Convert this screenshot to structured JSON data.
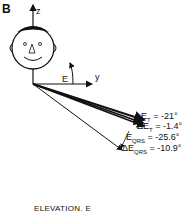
{
  "panel": {
    "label": "B"
  },
  "axes": {
    "z_label": "z",
    "y_label": "y",
    "angle_label": "E"
  },
  "annotations": [
    {
      "name": "E",
      "sub": "T",
      "prefix": "",
      "value": "= -21°"
    },
    {
      "name": "E",
      "sub": "T",
      "prefix": "Δ",
      "value": "= -1.4°"
    },
    {
      "name": "E",
      "sub": "QRS",
      "prefix": "",
      "value": "= -25.6°"
    },
    {
      "name": "E",
      "sub": "QRS",
      "prefix": "Δ",
      "value": "= -10.9°"
    }
  ],
  "footer": {
    "caption": "ELEVATION, E"
  }
}
